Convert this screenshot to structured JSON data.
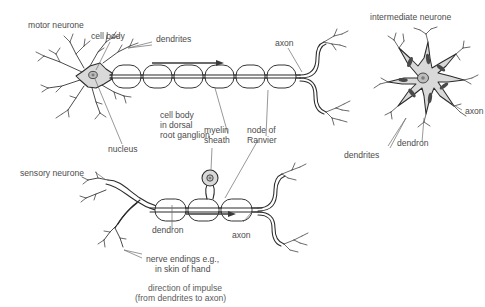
{
  "figure": {
    "title": "",
    "background_color": "#ffffff",
    "soma_fill": "#d9d9d9",
    "outline_color": "#2b2b2b",
    "label_color": "#4c4c4c"
  },
  "labels": {
    "motor_neurone": "motor neurone",
    "cell_body": "cell body",
    "dendrites": "dendrites",
    "axon_motor": "axon",
    "intermediate_neurone": "intermediate neurone",
    "cell_body_ganglion_line1": "cell body",
    "cell_body_ganglion_line2": "in dorsal",
    "cell_body_ganglion_line3": "root ganglion",
    "nucleus": "nucleus",
    "myelin_line1": "myelin",
    "myelin_line2": "sheath",
    "node_line1": "node of",
    "node_line2": "Ranvier",
    "sensory_neurone": "sensory neurone",
    "dendron_sensory": "dendron",
    "axon_sensory": "axon",
    "nerve_endings_line1": "nerve endings e.g.,",
    "nerve_endings_line2": "in skin of hand",
    "axon_intermediate": "axon",
    "dendron_intermediate": "dendron",
    "dendrites_intermediate": "dendrites"
  },
  "caption": {
    "line1": "direction of impulse",
    "line2": "(from dendrites to axon)"
  },
  "annotations": {
    "impulse_arrow_motor": "right-arrow",
    "impulse_arrow_sensory": "right-arrow"
  }
}
